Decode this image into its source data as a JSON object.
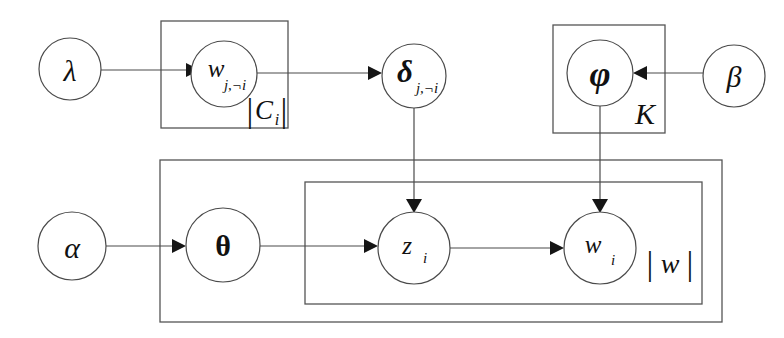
{
  "figure": {
    "kind": "plate-notation-graphical-model",
    "title": "",
    "background_color": "#ffffff",
    "stroke_color": "#4a4a4a",
    "text_color": "#111111"
  },
  "nodes": {
    "lambda": {
      "label": "λ",
      "sub": "",
      "cx": 70,
      "cy": 69,
      "r": 31
    },
    "w_j_not_i": {
      "label": "w",
      "sub": "j,¬i",
      "cx": 224,
      "cy": 74,
      "r": 33
    },
    "delta_j_not_i": {
      "label": "δ",
      "sub": "j,¬i",
      "cx": 414,
      "cy": 76,
      "r": 32
    },
    "phi": {
      "label": "φ",
      "sub": "",
      "cx": 600,
      "cy": 73,
      "r": 33
    },
    "beta": {
      "label": "β",
      "sub": "",
      "cx": 734,
      "cy": 76,
      "r": 31
    },
    "alpha": {
      "label": "α",
      "sub": "",
      "cx": 72,
      "cy": 246,
      "r": 34
    },
    "theta": {
      "label": "θ",
      "sub": "",
      "cx": 223,
      "cy": 245,
      "r": 37
    },
    "z_i": {
      "label": "z",
      "sub": "i",
      "cx": 414,
      "cy": 248,
      "r": 36
    },
    "w_i": {
      "label": "w",
      "sub": "i",
      "cx": 600,
      "cy": 248,
      "r": 36
    }
  },
  "plates": {
    "c_plate": {
      "label_main": "C",
      "label_sub": "i",
      "label_bars": "| |",
      "label_text": "|Cᵢ|",
      "x": 161,
      "y": 21,
      "w": 127,
      "h": 107
    },
    "k_plate": {
      "label_main": "K",
      "label_sub": "",
      "label_text": "K",
      "x": 553,
      "y": 25,
      "w": 112,
      "h": 108
    },
    "outer_doc_plate": {
      "label_text": "",
      "x": 160,
      "y": 160,
      "w": 562,
      "h": 162
    },
    "word_plate": {
      "label_main": "w",
      "label_sub": "",
      "label_text": "|w|",
      "x": 305,
      "y": 182,
      "w": 397,
      "h": 122
    }
  },
  "edges": [
    {
      "name": "lambda-to-w",
      "from": "lambda",
      "to": "w_j_not_i",
      "kind": "horizontal-arrow"
    },
    {
      "name": "w-to-delta",
      "from": "w_j_not_i",
      "to": "delta_j_not_i",
      "kind": "horizontal-arrow"
    },
    {
      "name": "beta-to-phi",
      "from": "beta",
      "to": "phi",
      "kind": "horizontal-arrow-left"
    },
    {
      "name": "delta-to-z",
      "from": "delta_j_not_i",
      "to": "z_i",
      "kind": "vertical-arrow"
    },
    {
      "name": "phi-to-w",
      "from": "phi",
      "to": "w_i",
      "kind": "vertical-arrow"
    },
    {
      "name": "alpha-to-theta",
      "from": "alpha",
      "to": "theta",
      "kind": "horizontal-arrow"
    },
    {
      "name": "theta-to-z",
      "from": "theta",
      "to": "z_i",
      "kind": "horizontal-arrow"
    },
    {
      "name": "z-to-w",
      "from": "z_i",
      "to": "w_i",
      "kind": "horizontal-arrow"
    }
  ]
}
